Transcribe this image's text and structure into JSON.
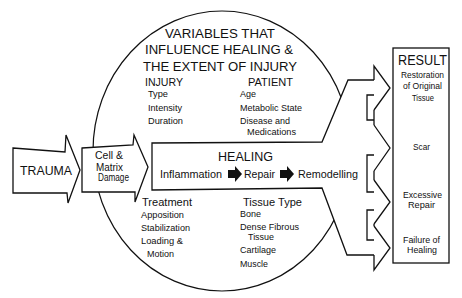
{
  "diagram": {
    "trauma": {
      "label": "TRAUMA"
    },
    "damage": {
      "lines": [
        "Cell &",
        "Matrix",
        "Damage"
      ]
    },
    "variables": {
      "title_lines": [
        "VARIABLES THAT",
        "INFLUENCE HEALING &",
        "THE EXTENT OF INJURY"
      ],
      "injury": {
        "heading": "INJURY",
        "items": [
          {
            "lines": [
              "Type"
            ]
          },
          {
            "lines": [
              "Intensity"
            ]
          },
          {
            "lines": [
              "Duration"
            ]
          }
        ]
      },
      "patient": {
        "heading": "PATIENT",
        "items": [
          {
            "lines": [
              "Age"
            ]
          },
          {
            "lines": [
              "Metabolic State"
            ]
          },
          {
            "lines": [
              "Disease and",
              "Medications"
            ]
          }
        ]
      },
      "treatment": {
        "heading": "Treatment",
        "items": [
          {
            "lines": [
              "Apposition"
            ]
          },
          {
            "lines": [
              "Stabilization"
            ]
          },
          {
            "lines": [
              "Loading &",
              "Motion"
            ]
          }
        ]
      },
      "tissue_type": {
        "heading": "Tissue Type",
        "items": [
          {
            "lines": [
              "Bone"
            ]
          },
          {
            "lines": [
              "Dense Fibrous",
              "Tissue"
            ]
          },
          {
            "lines": [
              "Cartilage"
            ]
          },
          {
            "lines": [
              "Muscle"
            ]
          }
        ]
      }
    },
    "healing": {
      "title": "HEALING",
      "stages": [
        "Inflammation",
        "Repair",
        "Remodelling"
      ]
    },
    "result": {
      "title": "RESULT",
      "outcomes": [
        {
          "lines": [
            "Restoration",
            "of Original",
            "Tissue"
          ]
        },
        {
          "lines": [
            "Scar"
          ]
        },
        {
          "lines": [
            "Excessive",
            "Repair"
          ]
        },
        {
          "lines": [
            "Failure of",
            "Healing"
          ]
        }
      ]
    }
  },
  "icons": {
    "stage_arrow": "solid-right-arrow",
    "flow_arrow": "outline-right-arrow"
  },
  "colors": {
    "line": "#111111",
    "background": "#ffffff",
    "stage_arrow_fill": "#111111"
  }
}
